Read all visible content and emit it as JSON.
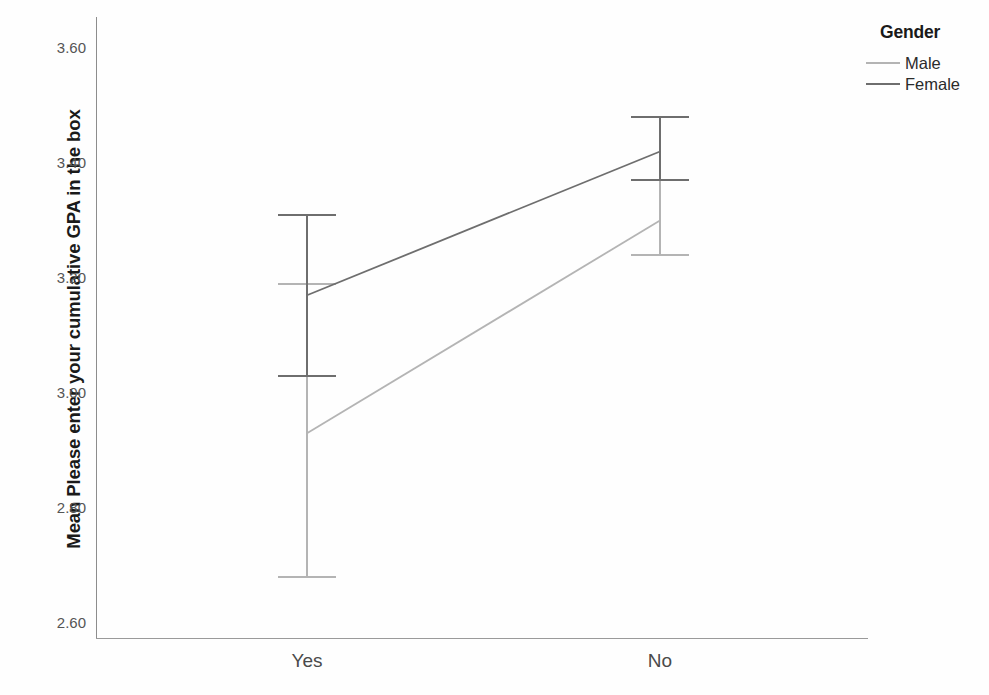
{
  "chart_data": {
    "type": "line",
    "title": "",
    "xlabel": "",
    "ylabel": "Mean Please enter your cumulative GPA in the box",
    "categories": [
      "Yes",
      "No"
    ],
    "ylim": [
      2.52,
      3.67
    ],
    "yticks": [
      "2.60",
      "2.80",
      "3.00",
      "3.20",
      "3.40",
      "3.60"
    ],
    "ytick_values": [
      2.6,
      2.8,
      3.0,
      3.2,
      3.4,
      3.6
    ],
    "grid": false,
    "legend_position": "top-right",
    "legend_title": "Gender",
    "error_bars": true,
    "series": [
      {
        "name": "Male",
        "color": "#b4b4b4",
        "values": [
          2.93,
          3.3
        ],
        "err_low": [
          2.68,
          3.24
        ],
        "err_high": [
          3.19,
          3.37
        ]
      },
      {
        "name": "Female",
        "color": "#6e6e6e",
        "values": [
          3.17,
          3.42
        ],
        "err_low": [
          3.03,
          3.37
        ],
        "err_high": [
          3.31,
          3.48
        ]
      }
    ]
  },
  "legend": {
    "title": "Gender",
    "items": [
      {
        "label": "Male",
        "color": "#b4b4b4"
      },
      {
        "label": "Female",
        "color": "#6e6e6e"
      }
    ]
  },
  "axes": {
    "y_title": "Mean Please enter your cumulative GPA in the box",
    "x_categories": [
      "Yes",
      "No"
    ],
    "y_tick_labels": [
      "3.60",
      "3.40",
      "3.20",
      "3.00",
      "2.80",
      "2.60"
    ]
  },
  "colors": {
    "background": "#fefefe",
    "axis": "#8d8d8d",
    "tick_text": "#555555",
    "title_text": "#1a1a1a",
    "male": "#b4b4b4",
    "female": "#6e6e6e"
  }
}
